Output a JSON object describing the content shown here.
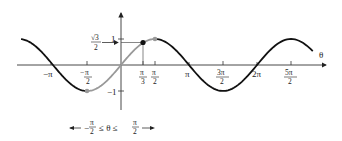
{
  "chart_data": {
    "type": "line",
    "title": "",
    "function": "sin(theta)",
    "xlabel": "θ",
    "ylabel": "",
    "x_ticks": [
      "−π",
      "−π/2",
      "π/3",
      "π/2",
      "π",
      "3π/2",
      "2π",
      "5π/2"
    ],
    "y_ticks": [
      "1",
      "√3/2",
      "−1"
    ],
    "xlim": [
      "≈−1.5π",
      "≈2.85π"
    ],
    "ylim": [
      -1,
      1
    ],
    "series": [
      {
        "name": "sin θ (full)",
        "color": "#111111",
        "x_range": [
          "−1.5π",
          "2.85π"
        ]
      },
      {
        "name": "sin θ restricted",
        "color": "#999999",
        "x_range": [
          "−π/2",
          "π/2"
        ]
      }
    ],
    "points": [
      {
        "x": "−π/2",
        "y": -1,
        "color": "#999999"
      },
      {
        "x": "π/3",
        "y": "√3/2",
        "color": "#111111"
      },
      {
        "x": "π/2",
        "y": 1,
        "color": "#999999"
      }
    ],
    "annotations": {
      "sqrt3_label_num": "√3",
      "sqrt3_label_den": "2",
      "domain_label": "−π/2 ≤ θ ≤ π/2"
    },
    "grid": false
  },
  "labels": {
    "theta": "θ",
    "y_one": "1",
    "y_neg_one": "−1",
    "sqrt3": "√3",
    "two": "2",
    "neg_pi": "−π",
    "pi": "π",
    "two_pi": "2π",
    "pi_sym": "π",
    "three_pi": "3π",
    "five_pi": "5π",
    "three": "3",
    "minus": "−",
    "domain_left": "−",
    "domain_mid": "≤ θ ≤"
  }
}
